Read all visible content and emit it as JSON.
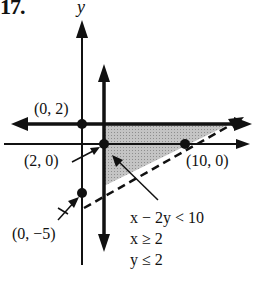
{
  "figure": {
    "problem_number": "17.",
    "y_axis_label": "y",
    "points": [
      {
        "label": "(0, 2)",
        "x": 0,
        "y": 2
      },
      {
        "label": "(2, 0)",
        "x": 2,
        "y": 0
      },
      {
        "label": "(10, 0)",
        "x": 10,
        "y": 0
      },
      {
        "label": "(0, −5)",
        "x": 0,
        "y": -5
      }
    ],
    "inequalities": [
      {
        "lhs": "x − 2y",
        "op": "<",
        "rhs": "10",
        "text": "x − 2y < 10"
      },
      {
        "lhs": "x",
        "op": "≥",
        "rhs": "2",
        "text": "x ≥ 2"
      },
      {
        "lhs": "y",
        "op": "≤",
        "rhs": "2",
        "text": "y ≤ 2"
      }
    ],
    "boundary_lines": [
      {
        "equation": "x = 2",
        "style": "solid"
      },
      {
        "equation": "y = 2",
        "style": "solid"
      },
      {
        "equation": "x − 2y = 10",
        "style": "dashed"
      }
    ],
    "shaded_region": "triangle with vertices (2, 2), (14, 2), (2, −4)",
    "colors": {
      "ink": "#111111",
      "shade": "#b8b8b8",
      "background": "#ffffff"
    }
  }
}
